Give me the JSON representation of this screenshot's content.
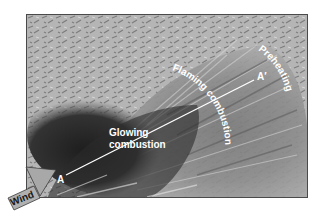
{
  "figure": {
    "labels": {
      "preheating": "Preheating",
      "flaming": "Flaming combustion",
      "glowing_line1": "Glowing",
      "glowing_line2": "combustion",
      "point_a": "A",
      "point_a_prime": "A′",
      "wind": "Wind"
    },
    "icons": {
      "wind_arrow": "arrow-icon"
    },
    "colors": {
      "label_text": "#ffffff",
      "frame_border": "#4a4a4a",
      "background_light": "#b8b8b8",
      "smoke_mid": "#8a8a8a",
      "char_dark": "#2a2a2a",
      "arrow_fill": "#a8a8a8"
    }
  }
}
